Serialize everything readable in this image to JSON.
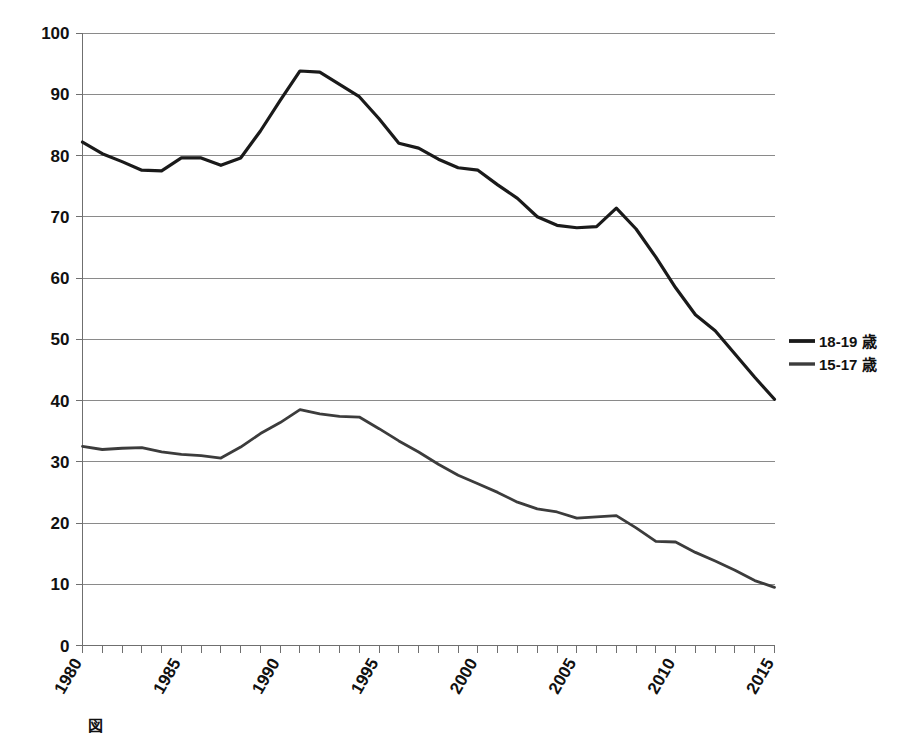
{
  "chart_data": {
    "type": "line",
    "title": "",
    "xlabel": "",
    "ylabel": "",
    "xlim": [
      1980,
      2015
    ],
    "ylim": [
      0,
      100
    ],
    "ytick_step": 10,
    "xtick_label_step": 5,
    "xtick_minor_step": 1,
    "grid": "horizontal",
    "legend_position": "right",
    "x": [
      1980,
      1981,
      1982,
      1983,
      1984,
      1985,
      1986,
      1987,
      1988,
      1989,
      1990,
      1991,
      1992,
      1993,
      1994,
      1995,
      1996,
      1997,
      1998,
      1999,
      2000,
      2001,
      2002,
      2003,
      2004,
      2005,
      2006,
      2007,
      2008,
      2009,
      2010,
      2011,
      2012,
      2013,
      2014,
      2015
    ],
    "xtick_labels": [
      "1980",
      "1985",
      "1990",
      "1995",
      "2000",
      "2005",
      "2010",
      "2015"
    ],
    "ytick_labels": [
      "0",
      "10",
      "20",
      "30",
      "40",
      "50",
      "60",
      "70",
      "80",
      "90",
      "100"
    ],
    "series": [
      {
        "name": "18-19 歳",
        "color": "#1a1a1a",
        "width": 3.2,
        "values": [
          82.2,
          80.3,
          79.0,
          77.6,
          77.5,
          79.6,
          79.6,
          78.4,
          79.6,
          84.0,
          89.0,
          93.8,
          93.6,
          91.6,
          89.6,
          86.0,
          82.0,
          81.2,
          79.4,
          78.0,
          77.6,
          75.2,
          73.0,
          70.0,
          68.6,
          68.2,
          68.4,
          71.4,
          68.0,
          63.4,
          58.4,
          54.0,
          51.4,
          47.6,
          43.8,
          40.2
        ]
      },
      {
        "name": "15-17 歳",
        "color": "#3c3c3c",
        "width": 2.8,
        "values": [
          32.5,
          32.0,
          32.2,
          32.3,
          31.6,
          31.2,
          31.0,
          30.6,
          32.4,
          34.6,
          36.4,
          38.5,
          37.8,
          37.4,
          37.3,
          35.4,
          33.4,
          31.6,
          29.6,
          27.8,
          26.4,
          25.0,
          23.4,
          22.3,
          21.8,
          20.8,
          21.0,
          21.2,
          19.2,
          17.0,
          16.9,
          15.2,
          13.8,
          12.3,
          10.6,
          9.5
        ]
      }
    ]
  },
  "legend": {
    "items": [
      {
        "label": "18-19 歳"
      },
      {
        "label": "15-17 歳"
      }
    ]
  },
  "caption": {
    "text": "図"
  }
}
